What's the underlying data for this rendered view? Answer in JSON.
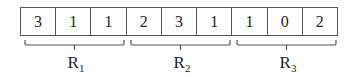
{
  "diagram": {
    "cells": [
      "3",
      "1",
      "1",
      "2",
      "3",
      "1",
      "1",
      "0",
      "2"
    ],
    "groups": [
      {
        "letter": "R",
        "subscript": "1",
        "start": 0,
        "end": 2
      },
      {
        "letter": "R",
        "subscript": "2",
        "start": 3,
        "end": 5
      },
      {
        "letter": "R",
        "subscript": "3",
        "start": 6,
        "end": 8
      }
    ]
  }
}
